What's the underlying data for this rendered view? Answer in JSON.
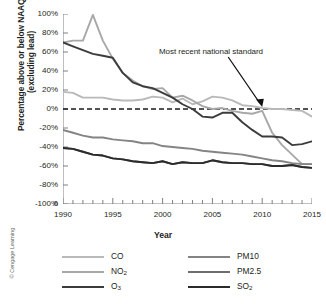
{
  "figure": {
    "credit": "© Cengage Learning"
  },
  "chart_data": {
    "type": "line",
    "title": "",
    "xlabel": "Year",
    "ylabel": "Percentage above or below NAAQS (excluding lead)",
    "ylabel_line1": "Percentage above or below NAAQS",
    "ylabel_line2": "(excluding lead)",
    "xlim": [
      1990,
      2015
    ],
    "ylim": [
      -100,
      100
    ],
    "grid": false,
    "legend_position": "below",
    "x_ticks": [
      1990,
      1995,
      2000,
      2005,
      2010,
      2015
    ],
    "x_tick_labels": [
      "1990",
      "1995",
      "2000",
      "2005",
      "2010",
      "2015"
    ],
    "x_minor_tick_step": 1,
    "y_ticks": [
      100,
      80,
      60,
      40,
      20,
      0,
      -20,
      -40,
      -60,
      -80,
      -100
    ],
    "y_tick_labels": [
      "100%",
      "80%",
      "60%",
      "40%",
      "20%",
      "0%",
      "-20%",
      "-40%",
      "-60%",
      "-80%",
      "-100%"
    ],
    "y_axis_break_label": "0",
    "reference_line": {
      "value": 0,
      "style": "dashed",
      "color": "#1a1a1a",
      "label": "Most recent national standard"
    },
    "annotation": {
      "text": "Most recent national standard",
      "points_to_x": 2010,
      "points_to_y": 0
    },
    "x": [
      1990,
      1991,
      1992,
      1993,
      1994,
      1995,
      1996,
      1997,
      1998,
      1999,
      2000,
      2001,
      2002,
      2003,
      2004,
      2005,
      2006,
      2007,
      2008,
      2009,
      2010,
      2011,
      2012,
      2013,
      2014,
      2015
    ],
    "series": [
      {
        "name": "CO",
        "color": "#b9b9b9",
        "values": [
          18,
          17,
          12,
          12,
          12,
          10,
          9,
          9,
          10,
          13,
          12,
          7,
          11,
          5,
          8,
          13,
          12,
          9,
          4,
          3,
          1,
          0,
          0,
          -1,
          -2,
          -8
        ]
      },
      {
        "name": "NO2",
        "color": "#a8a8a8",
        "values": [
          70,
          72,
          72,
          99,
          72,
          53,
          38,
          30,
          24,
          21,
          22,
          12,
          14,
          9,
          3,
          0,
          1,
          -2,
          -4,
          -5,
          -2,
          -25,
          -38,
          -48,
          -58,
          -58
        ]
      },
      {
        "name": "O3",
        "color": "#3c3c3c",
        "values": [
          70,
          66,
          62,
          58,
          56,
          54,
          38,
          28,
          24,
          22,
          17,
          12,
          5,
          0,
          -8,
          -9,
          -4,
          -4,
          -14,
          -22,
          -29,
          -29,
          -30,
          -38,
          -37,
          -34
        ]
      },
      {
        "name": "PM10",
        "color": "#848484",
        "values": [
          -22,
          -25,
          -28,
          -30,
          -30,
          -32,
          -33,
          -34,
          -36,
          -36,
          -39,
          -40,
          -41,
          -42,
          -44,
          -45,
          -46,
          -47,
          -48,
          -50,
          -52,
          -54,
          -55,
          -57,
          -58,
          -58
        ]
      },
      {
        "name": "PM2.5",
        "color": "#6e6e6e",
        "values": [
          -41,
          -42,
          -45,
          -48,
          -49,
          -52,
          -53,
          -55,
          -56,
          -57,
          -55,
          -58,
          -56,
          -57,
          -57,
          -54,
          -56,
          -57,
          -57,
          -58,
          -58,
          -60,
          -60,
          -59,
          -61,
          -62
        ]
      },
      {
        "name": "SO2",
        "color": "#2b2b2b",
        "values": [
          -41,
          -42,
          -45,
          -48,
          -49,
          -52,
          -53,
          -55,
          -56,
          -57,
          -55,
          -58,
          -56,
          -57,
          -57,
          -54,
          -56,
          -57,
          -57,
          -58,
          -58,
          -60,
          -60,
          -59,
          -61,
          -62
        ]
      }
    ],
    "legend": [
      {
        "label": "CO",
        "sub": "",
        "color": "#b9b9b9"
      },
      {
        "label": "NO",
        "sub": "2",
        "color": "#a8a8a8"
      },
      {
        "label": "O",
        "sub": "3",
        "color": "#3c3c3c"
      },
      {
        "label": "PM10",
        "sub": "",
        "color": "#848484"
      },
      {
        "label": "PM2.5",
        "sub": "",
        "color": "#6e6e6e"
      },
      {
        "label": "SO",
        "sub": "2",
        "color": "#2b2b2b"
      }
    ]
  }
}
